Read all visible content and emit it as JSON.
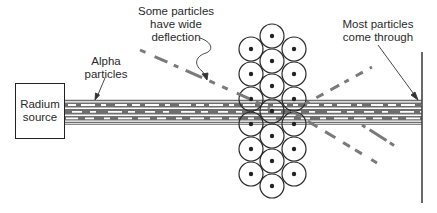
{
  "diagram": {
    "source": {
      "line1": "Radium",
      "line2": "source"
    },
    "labels": {
      "alpha": {
        "line1": "Alpha",
        "line2": "particles"
      },
      "wide_deflection": {
        "line1": "Some particles",
        "line2": "have wide",
        "line3": "deflection"
      },
      "most_through": {
        "line1": "Most particles",
        "line2": "come through"
      }
    },
    "colors": {
      "beam": "#6e6e6e",
      "beam_dash": "#ffffff",
      "deflection": "#7a7a7a",
      "outline": "#2a2a2a",
      "text": "#2a2a2a"
    },
    "atoms": {
      "radius": 12,
      "center_column": {
        "x": 272,
        "ys": [
          36,
          61,
          86,
          111,
          136,
          161,
          186
        ]
      },
      "side_columns": {
        "xs": [
          251,
          294
        ],
        "ys": [
          49,
          74,
          99,
          124,
          149,
          174
        ]
      }
    }
  }
}
